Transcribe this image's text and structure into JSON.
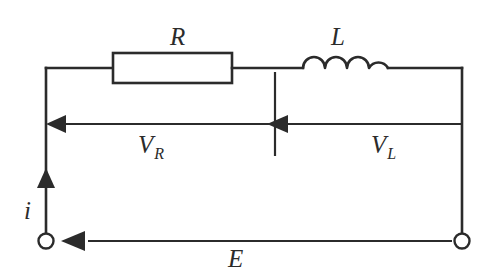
{
  "diagram": {
    "type": "schematic",
    "background_color": "#ffffff",
    "line_color": "#2b2b2b",
    "components": {
      "resistor": {
        "symbol_label": "R",
        "shape": "rectangle-box",
        "position": "top rail, left half"
      },
      "inductor": {
        "symbol_label": "L",
        "shape": "four-arc-coil",
        "coil_count": 4,
        "position": "top rail, right half"
      }
    },
    "labels": {
      "resistor_label": "R",
      "inductor_label": "L",
      "voltage_resistor_main": "V",
      "voltage_resistor_sub": "R",
      "voltage_inductor_main": "V",
      "voltage_inductor_sub": "L",
      "current_label": "i",
      "source_label": "E"
    },
    "arrows": {
      "voltage_left_arrow": "points-left",
      "voltage_mid_arrow": "points-left",
      "current_arrow": "points-up",
      "source_arrow": "points-left"
    },
    "terminals": {
      "left_terminal": "open-circle",
      "right_terminal": "open-circle"
    }
  }
}
